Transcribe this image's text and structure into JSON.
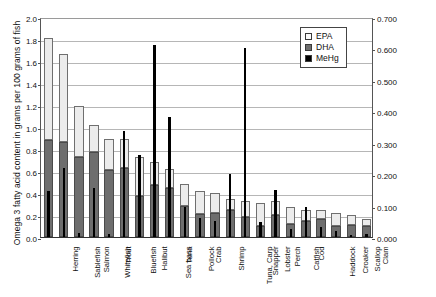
{
  "chart_data": {
    "type": "bar",
    "title": "",
    "subtitle": "",
    "xlabel": "",
    "ylabel": "Omega 3 fatty acid content in grams per 100 grams of fish",
    "ylabel_secondary": "Methylmercury (ppm)",
    "ylim": [
      0.0,
      2.0
    ],
    "ylim_secondary": [
      0.0,
      0.7
    ],
    "yticks": [
      "0.0",
      "0.2",
      "0.4",
      "0.6",
      "0.8",
      "1.0",
      "1.2",
      "1.4",
      "1.6",
      "1.8",
      "2.0"
    ],
    "yticks_secondary": [
      "0.000",
      "0.100",
      "0.200",
      "0.300",
      "0.400",
      "0.500",
      "0.600",
      "0.700"
    ],
    "grid": true,
    "legend_position": "top-right",
    "legend": [
      "EPA",
      "DHA",
      "MeHg"
    ],
    "stacked_series": [
      "DHA",
      "EPA"
    ],
    "overlay_series": [
      "MeHg"
    ],
    "categories": [
      "Herring",
      "Sablefish",
      "Salmon",
      "Whitefish",
      "Trout",
      "Bluefish",
      "Halibut",
      "Sea bass",
      "Tuna",
      "Pollock",
      "Crab",
      "Shrimp",
      "Tuna, Carp",
      "Snapper",
      "Lobster",
      "Perch",
      "Catfish",
      "Cod",
      "Haddock",
      "Croaker",
      "Scallop",
      "Clam"
    ],
    "series": [
      {
        "name": "DHA",
        "axis": "left",
        "unit": "g per 100 g fish",
        "values": [
          0.88,
          0.86,
          0.73,
          0.77,
          0.61,
          0.63,
          0.37,
          0.47,
          0.45,
          0.28,
          0.21,
          0.22,
          0.25,
          0.18,
          0.1,
          0.2,
          0.12,
          0.15,
          0.16,
          0.1,
          0.11,
          0.1
        ]
      },
      {
        "name": "EPA",
        "axis": "left",
        "unit": "g per 100 g fish",
        "values": [
          0.93,
          0.8,
          0.46,
          0.25,
          0.28,
          0.26,
          0.36,
          0.21,
          0.17,
          0.2,
          0.21,
          0.18,
          0.1,
          0.15,
          0.21,
          0.13,
          0.15,
          0.1,
          0.09,
          0.12,
          0.09,
          0.06
        ]
      },
      {
        "name": "Total Omega 3 (DHA + EPA)",
        "axis": "left",
        "unit": "g per 100 g fish",
        "values": [
          1.81,
          1.66,
          1.19,
          1.02,
          0.89,
          0.89,
          0.73,
          0.68,
          0.62,
          0.48,
          0.42,
          0.4,
          0.35,
          0.33,
          0.31,
          0.33,
          0.27,
          0.25,
          0.25,
          0.22,
          0.2,
          0.16
        ]
      },
      {
        "name": "MeHg",
        "axis": "right",
        "unit": "ppm",
        "values": [
          0.146,
          0.22,
          0.014,
          0.157,
          0.01,
          0.337,
          0.26,
          0.61,
          0.383,
          0.094,
          0.06,
          0.05,
          0.2,
          0.6,
          0.047,
          0.15,
          0.025,
          0.095,
          0.031,
          0.018,
          0.005,
          0.009
        ]
      }
    ]
  },
  "legend": {
    "items": [
      {
        "label": "EPA",
        "swatch": "epa-swatch"
      },
      {
        "label": "DHA",
        "swatch": "dha-swatch"
      },
      {
        "label": "MeHg",
        "swatch": "mehg-swatch"
      }
    ]
  },
  "colors": {
    "epa": "#ececec",
    "dha": "#6e6e6e",
    "mehg": "#000000",
    "grid": "#b6b6b6",
    "axis": "#333333",
    "background": "#ffffff"
  }
}
